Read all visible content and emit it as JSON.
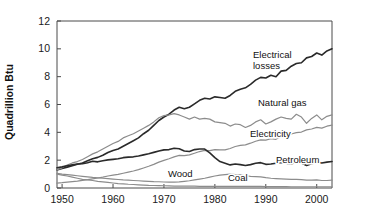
{
  "chart_data": {
    "type": "line",
    "title": "",
    "subtitle": "",
    "xlabel": "",
    "ylabel": "Quadrillion Btu",
    "xlim": [
      1949,
      2003
    ],
    "ylim": [
      0,
      12
    ],
    "grid": false,
    "legend_position": "inline-labels",
    "x_ticks": [
      1950,
      1960,
      1970,
      1980,
      1990,
      2000
    ],
    "x_tick_labels": [
      "1950",
      "1960",
      "1970",
      "1980",
      "1990",
      "2000"
    ],
    "y_ticks": [
      0,
      2,
      4,
      6,
      8,
      10,
      12
    ],
    "y_tick_labels": [
      "0",
      "2",
      "4",
      "6",
      "8",
      "10",
      "12"
    ],
    "x": [
      1949,
      1950,
      1951,
      1952,
      1953,
      1954,
      1955,
      1956,
      1957,
      1958,
      1959,
      1960,
      1961,
      1962,
      1963,
      1964,
      1965,
      1966,
      1967,
      1968,
      1969,
      1970,
      1971,
      1972,
      1973,
      1974,
      1975,
      1976,
      1977,
      1978,
      1979,
      1980,
      1981,
      1982,
      1983,
      1984,
      1985,
      1986,
      1987,
      1988,
      1989,
      1990,
      1991,
      1992,
      1993,
      1994,
      1995,
      1996,
      1997,
      1998,
      1999,
      2000,
      2001,
      2002,
      2003
    ],
    "series": [
      {
        "name": "Electrical losses",
        "color": "#2a2a2a",
        "width": 1.6,
        "label": "Electrical losses",
        "label_x": 2525,
        "values": [
          1.3,
          1.4,
          1.5,
          1.6,
          1.7,
          1.8,
          1.95,
          2.1,
          2.2,
          2.35,
          2.55,
          2.7,
          2.8,
          3.0,
          3.2,
          3.4,
          3.6,
          3.9,
          4.15,
          4.5,
          4.85,
          5.1,
          5.3,
          5.6,
          5.8,
          5.7,
          5.8,
          6.05,
          6.3,
          6.45,
          6.4,
          6.55,
          6.5,
          6.45,
          6.65,
          6.95,
          7.1,
          7.2,
          7.45,
          7.75,
          7.95,
          7.9,
          8.1,
          8.0,
          8.4,
          8.45,
          8.75,
          8.95,
          9.0,
          9.35,
          9.45,
          9.7,
          9.55,
          9.85,
          10.0
        ]
      },
      {
        "name": "Natural gas",
        "color": "#8c8c8c",
        "width": 1.2,
        "label": "Natural gas",
        "values": [
          1.3,
          1.45,
          1.65,
          1.8,
          1.9,
          2.05,
          2.25,
          2.45,
          2.6,
          2.8,
          3.0,
          3.2,
          3.35,
          3.6,
          3.75,
          3.9,
          4.1,
          4.3,
          4.5,
          4.75,
          5.05,
          5.2,
          5.25,
          5.35,
          5.25,
          5.1,
          4.95,
          5.1,
          4.95,
          5.0,
          4.95,
          4.75,
          4.7,
          4.65,
          4.45,
          4.6,
          4.55,
          4.35,
          4.5,
          4.75,
          4.9,
          4.6,
          4.75,
          4.95,
          5.1,
          5.0,
          4.95,
          5.3,
          5.1,
          4.65,
          5.0,
          5.25,
          4.9,
          5.15,
          5.25
        ]
      },
      {
        "name": "Electricity",
        "color": "#8c8c8c",
        "width": 1.2,
        "label": "Electricity",
        "values": [
          0.35,
          0.38,
          0.42,
          0.46,
          0.5,
          0.55,
          0.6,
          0.66,
          0.72,
          0.78,
          0.86,
          0.92,
          0.98,
          1.06,
          1.14,
          1.22,
          1.32,
          1.44,
          1.56,
          1.7,
          1.86,
          1.98,
          2.1,
          2.24,
          2.34,
          2.32,
          2.38,
          2.5,
          2.62,
          2.7,
          2.68,
          2.76,
          2.74,
          2.74,
          2.84,
          2.98,
          3.06,
          3.1,
          3.22,
          3.36,
          3.46,
          3.44,
          3.54,
          3.5,
          3.7,
          3.74,
          3.88,
          3.98,
          4.02,
          4.18,
          4.24,
          4.36,
          4.3,
          4.44,
          4.52
        ]
      },
      {
        "name": "Petroleum",
        "color": "#2a2a2a",
        "width": 1.6,
        "label": "Petroleum",
        "values": [
          1.45,
          1.52,
          1.6,
          1.66,
          1.72,
          1.74,
          1.82,
          1.92,
          1.88,
          1.96,
          2.02,
          2.06,
          2.1,
          2.18,
          2.22,
          2.24,
          2.3,
          2.38,
          2.46,
          2.56,
          2.66,
          2.74,
          2.76,
          2.86,
          2.82,
          2.66,
          2.62,
          2.76,
          2.8,
          2.8,
          2.52,
          2.18,
          1.9,
          1.78,
          1.66,
          1.72,
          1.68,
          1.62,
          1.68,
          1.78,
          1.82,
          1.7,
          1.72,
          1.78,
          1.84,
          1.78,
          1.72,
          1.86,
          1.8,
          1.62,
          1.74,
          1.86,
          1.8,
          1.86,
          1.9
        ]
      },
      {
        "name": "Wood",
        "color": "#8c8c8c",
        "width": 1.2,
        "label": "Wood",
        "values": [
          1.05,
          1.0,
          0.96,
          0.92,
          0.88,
          0.84,
          0.8,
          0.76,
          0.73,
          0.7,
          0.67,
          0.64,
          0.61,
          0.58,
          0.56,
          0.54,
          0.52,
          0.5,
          0.48,
          0.46,
          0.45,
          0.43,
          0.42,
          0.42,
          0.44,
          0.48,
          0.52,
          0.58,
          0.64,
          0.7,
          0.78,
          0.86,
          0.92,
          0.96,
          1.0,
          0.96,
          0.94,
          0.88,
          0.84,
          0.82,
          0.8,
          0.74,
          0.7,
          0.68,
          0.66,
          0.64,
          0.62,
          0.62,
          0.6,
          0.56,
          0.56,
          0.58,
          0.54,
          0.54,
          0.56
        ]
      },
      {
        "name": "Coal",
        "color": "#8c8c8c",
        "width": 1.2,
        "label": "Coal",
        "values": [
          1.0,
          0.92,
          0.86,
          0.78,
          0.7,
          0.62,
          0.58,
          0.54,
          0.48,
          0.44,
          0.4,
          0.36,
          0.32,
          0.3,
          0.27,
          0.25,
          0.23,
          0.21,
          0.19,
          0.18,
          0.17,
          0.16,
          0.15,
          0.14,
          0.14,
          0.13,
          0.13,
          0.13,
          0.12,
          0.12,
          0.12,
          0.12,
          0.12,
          0.12,
          0.12,
          0.12,
          0.12,
          0.11,
          0.11,
          0.11,
          0.11,
          0.1,
          0.1,
          0.1,
          0.1,
          0.1,
          0.09,
          0.09,
          0.09,
          0.09,
          0.09,
          0.09,
          0.09,
          0.09,
          0.09
        ]
      }
    ],
    "annotations": [
      {
        "text": "Electrical losses",
        "line1": "Electrical",
        "line2": "losses",
        "x": 253,
        "y": 58
      },
      {
        "text": "Natural gas",
        "line1": "Natural gas",
        "line2": "",
        "x": 258,
        "y": 106
      },
      {
        "text": "Electricity",
        "line1": "Electricity",
        "line2": "",
        "x": 250,
        "y": 137
      },
      {
        "text": "Petroleum",
        "line1": "Petroleum",
        "line2": "",
        "x": 276,
        "y": 163
      },
      {
        "text": "Wood",
        "line1": "Wood",
        "line2": "",
        "x": 168,
        "y": 177
      },
      {
        "text": "Coal",
        "line1": "Coal",
        "line2": "",
        "x": 228,
        "y": 181
      }
    ]
  },
  "axis": {
    "y_label": "Quadrillion Btu"
  }
}
